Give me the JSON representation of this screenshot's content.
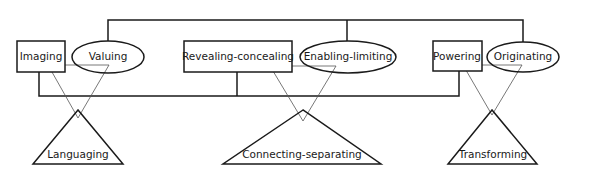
{
  "diagram": {
    "processes": {
      "imaging": "Imaging",
      "valuing": "Valuing",
      "revealing_concealing": "Revealing-concealing",
      "enabling_limiting": "Enabling-limiting",
      "powering": "Powering",
      "originating": "Originating"
    },
    "themes": {
      "languaging": "Languaging",
      "connecting_separating": "Connecting-separating",
      "transforming": "Transforming"
    },
    "colors": {
      "stroke": "#1a1a1a",
      "thin_stroke": "#555555",
      "background": "#ffffff"
    }
  }
}
